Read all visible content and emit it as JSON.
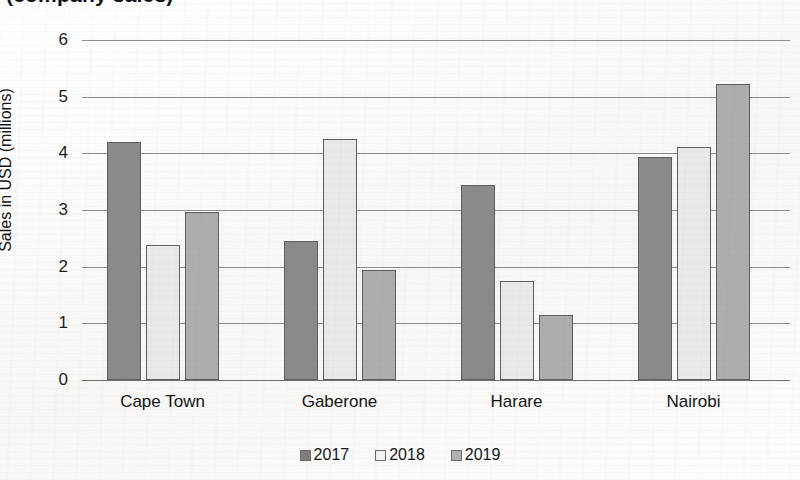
{
  "chart_data": {
    "type": "bar",
    "title": "(company sales)",
    "xlabel": "",
    "ylabel": "Sales in USD (millions)",
    "ylim": [
      0,
      6
    ],
    "yticks": [
      0,
      1,
      2,
      3,
      4,
      5,
      6
    ],
    "grid": true,
    "legend_position": "bottom",
    "categories": [
      "Cape Town",
      "Gaberone",
      "Harare",
      "Nairobi"
    ],
    "series": [
      {
        "name": "2017",
        "color": "#8a8a8a",
        "values": [
          4.2,
          2.45,
          3.44,
          3.93
        ]
      },
      {
        "name": "2018",
        "color": "#e9e9e9",
        "values": [
          2.38,
          4.25,
          1.74,
          4.12
        ]
      },
      {
        "name": "2019",
        "color": "#adadad",
        "values": [
          2.97,
          1.95,
          1.14,
          5.22
        ]
      }
    ]
  },
  "axis": {
    "y_title": "Sales in USD (millions)",
    "ticks": [
      "6",
      "5",
      "4",
      "3",
      "2",
      "1",
      "0"
    ]
  },
  "legend": {
    "items": [
      {
        "label": "2017"
      },
      {
        "label": "2018"
      },
      {
        "label": "2019"
      }
    ]
  },
  "colors": {
    "series_2017": "#8a8a8a",
    "series_2018": "#e9e9e9",
    "series_2019": "#adadad",
    "gridline": "#8d8d8d",
    "text": "#141414",
    "background": "#ffffff"
  }
}
